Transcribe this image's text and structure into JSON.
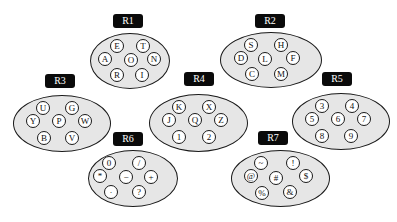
{
  "regions": [
    {
      "id": "R1",
      "label": "R1",
      "nodes": [
        "E",
        "T",
        "A",
        "O",
        "N",
        "R",
        "I"
      ]
    },
    {
      "id": "R2",
      "label": "R2",
      "nodes": [
        "S",
        "H",
        "D",
        "L",
        "F",
        "C",
        "M"
      ]
    },
    {
      "id": "R3",
      "label": "R3",
      "nodes": [
        "U",
        "G",
        "Y",
        "P",
        "W",
        "B",
        "V"
      ]
    },
    {
      "id": "R4",
      "label": "R4",
      "nodes": [
        "K",
        "X",
        "J",
        "Q",
        "Z",
        "1",
        "2"
      ]
    },
    {
      "id": "R5",
      "label": "R5",
      "nodes": [
        "3",
        "4",
        "5",
        "6",
        "7",
        "8",
        "9"
      ]
    },
    {
      "id": "R6",
      "label": "R6",
      "nodes": [
        "0",
        "/",
        "*",
        "−",
        "+",
        "·",
        "?"
      ]
    },
    {
      "id": "R7",
      "label": "R7",
      "nodes": [
        "~",
        "!",
        "@",
        "#",
        "$",
        "%",
        "&"
      ]
    }
  ],
  "colors": {
    "ellipse_fill": "#e6e6e6",
    "label_bg": "#0a0a0a",
    "node_fill": "#ffffff",
    "stroke": "#1a1a1a"
  }
}
